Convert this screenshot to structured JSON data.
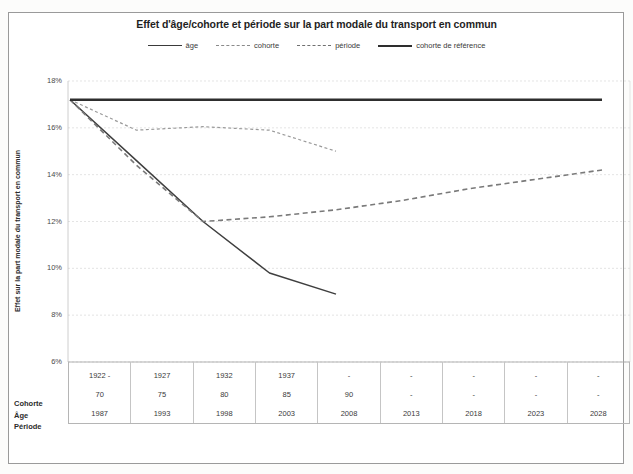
{
  "chart_data": {
    "type": "line",
    "title": "Effet d'âge/cohorte et période sur la part modale du transport en commun",
    "xlabel": "",
    "ylabel": "Effet sur la part modale du transport en commun",
    "ylim": [
      6,
      18
    ],
    "ytick_labels": [
      "18%",
      "16%",
      "14%",
      "12%",
      "10%",
      "8%",
      "6%"
    ],
    "ytick_values": [
      18,
      16,
      14,
      12,
      10,
      8,
      6
    ],
    "grid": true,
    "legend_position": "top",
    "x_categories": [
      "1987",
      "1993",
      "1998",
      "2003",
      "2008",
      "2013",
      "2018",
      "2023",
      "2028"
    ],
    "series": [
      {
        "name": "âge",
        "style": "solid",
        "color": "#3a3a3a",
        "x": [
          "1987",
          "1993",
          "1998",
          "2003",
          "2008"
        ],
        "values": [
          17.2,
          14.6,
          12.0,
          9.8,
          8.9
        ]
      },
      {
        "name": "cohorte",
        "style": "dotted",
        "color": "#8a8a8a",
        "x": [
          "1987",
          "1993",
          "1998",
          "2003",
          "2008"
        ],
        "values": [
          17.2,
          15.9,
          16.05,
          15.9,
          15.0
        ]
      },
      {
        "name": "période",
        "style": "dashed",
        "color": "#707070",
        "x": [
          "1987",
          "1993",
          "1998",
          "2003",
          "2008",
          "2013",
          "2018",
          "2023",
          "2028"
        ],
        "values": [
          17.2,
          14.4,
          12.0,
          12.2,
          12.5,
          12.9,
          13.4,
          13.8,
          14.2
        ]
      },
      {
        "name": "cohorte de référence",
        "style": "solid-thick",
        "color": "#2e2e2e",
        "x": [
          "1987",
          "2028"
        ],
        "values": [
          17.2,
          17.2
        ]
      }
    ]
  },
  "legend": {
    "items": [
      {
        "label": "âge",
        "swatch": "line-solid-icon"
      },
      {
        "label": "cohorte",
        "swatch": "line-dotted-icon"
      },
      {
        "label": "période",
        "swatch": "line-dashed-icon"
      },
      {
        "label": "cohorte de référence",
        "swatch": "line-thick-icon"
      }
    ]
  },
  "table": {
    "row_labels": [
      "Cohorte",
      "Âge",
      "Période"
    ],
    "columns": [
      {
        "cohorte": "1922 -",
        "age": "70",
        "periode": "1987"
      },
      {
        "cohorte": "1927",
        "age": "75",
        "periode": "1993"
      },
      {
        "cohorte": "1932",
        "age": "80",
        "periode": "1998"
      },
      {
        "cohorte": "1937",
        "age": "85",
        "periode": "2003"
      },
      {
        "cohorte": "-",
        "age": "90",
        "periode": "2008"
      },
      {
        "cohorte": "-",
        "age": "-",
        "periode": "2013"
      },
      {
        "cohorte": "-",
        "age": "-",
        "periode": "2018"
      },
      {
        "cohorte": "-",
        "age": "-",
        "periode": "2023"
      },
      {
        "cohorte": "-",
        "age": "-",
        "periode": "2028"
      }
    ]
  }
}
